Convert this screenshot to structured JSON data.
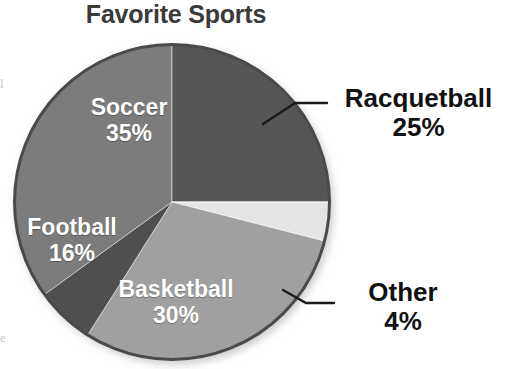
{
  "chart_data": {
    "type": "pie",
    "title": "Favorite Sports",
    "categories": [
      "Soccer",
      "Racquetball",
      "Other",
      "Basketball",
      "Football"
    ],
    "values": [
      35,
      25,
      4,
      30,
      16
    ],
    "value_suffix": "%",
    "labels": [
      "35%",
      "25%",
      "4%",
      "30%",
      "16%"
    ],
    "legend": "none",
    "grid": false,
    "slices": [
      {
        "name": "Soccer",
        "value": 35,
        "label": "35%",
        "color": "#7c7c7c",
        "label_placement": "inside",
        "label_color": "#ffffff",
        "start_angle_deg": 234.0,
        "end_angle_deg": 360.0
      },
      {
        "name": "Racquetball",
        "value": 25,
        "label": "25%",
        "color": "#565656",
        "label_placement": "callout",
        "label_color": "#111111",
        "start_angle_deg": 0.0,
        "end_angle_deg": 90.0
      },
      {
        "name": "Other",
        "value": 4,
        "label": "4%",
        "color": "#e4e4e4",
        "label_placement": "callout",
        "label_color": "#111111",
        "start_angle_deg": 90.0,
        "end_angle_deg": 104.4
      },
      {
        "name": "Basketball",
        "value": 30,
        "label": "30%",
        "color": "#a0a0a0",
        "label_placement": "inside",
        "label_color": "#ffffff",
        "start_angle_deg": 104.4,
        "end_angle_deg": 212.4
      },
      {
        "name": "Football",
        "value": 16,
        "label": "16%",
        "color": "#4f4f4f",
        "label_placement": "inside",
        "label_color": "#ffffff",
        "start_angle_deg": 212.4,
        "end_angle_deg": 234.0
      }
    ],
    "total": 110,
    "colors": {
      "soccer": "#7c7c7c",
      "racquetball": "#565656",
      "other": "#e4e4e4",
      "basketball": "#a0a0a0",
      "football": "#4f4f4f",
      "title": "#3a3a3a",
      "callout_text": "#111111",
      "inside_text": "#ffffff",
      "background": "#ffffff",
      "pie_outline": "#3f3f3f"
    }
  },
  "artifacts": {
    "left_top": "l",
    "left_bottom": "e"
  }
}
